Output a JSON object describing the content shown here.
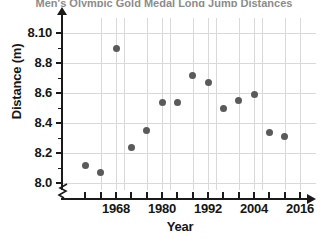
{
  "figure": {
    "title_sliver": "Men's Olympic Gold Medal Long Jump Distances",
    "background_color": "#ffffff",
    "point_color": "#5a5a5a",
    "axis_color": "#1a1a1a",
    "grid_color": "#d9d9d9"
  },
  "axes": {
    "y_title": "Distance (m)",
    "x_title": "Year",
    "y_tick_labels": [
      "8.10",
      "8.8",
      "8.6",
      "8.4",
      "8.2",
      "8.0"
    ],
    "x_tick_labels": [
      "1968",
      "1980",
      "1992",
      "2004",
      "2016"
    ],
    "y_break_symbol": "axis-break"
  },
  "chart_data": {
    "type": "scatter",
    "title": "Men's Olympic Gold Medal Long Jump Distances",
    "xlabel": "Year",
    "ylabel": "Distance (m)",
    "xlim": [
      1957,
      2020
    ],
    "ylim": [
      8.0,
      9.0
    ],
    "xticks": [
      1968,
      1980,
      1992,
      2004,
      2016
    ],
    "xtick_interval_minor": 4,
    "yticks": [
      8.0,
      8.2,
      8.4,
      8.6,
      8.8,
      9.0
    ],
    "ytick_labels": [
      "8.0",
      "8.2",
      "8.4",
      "8.6",
      "8.8",
      "8.10"
    ],
    "grid": true,
    "legend": "none",
    "y_axis_break": true,
    "x": [
      1960,
      1964,
      1968,
      1972,
      1976,
      1980,
      1984,
      1988,
      1992,
      1996,
      2000,
      2004,
      2008,
      2012
    ],
    "y": [
      8.12,
      8.07,
      8.9,
      8.24,
      8.35,
      8.54,
      8.54,
      8.72,
      8.67,
      8.5,
      8.55,
      8.59,
      8.34,
      8.31
    ],
    "points": [
      {
        "year": 1960,
        "distance": 8.12
      },
      {
        "year": 1964,
        "distance": 8.07
      },
      {
        "year": 1968,
        "distance": 8.9
      },
      {
        "year": 1972,
        "distance": 8.24
      },
      {
        "year": 1976,
        "distance": 8.35
      },
      {
        "year": 1980,
        "distance": 8.54
      },
      {
        "year": 1984,
        "distance": 8.54
      },
      {
        "year": 1988,
        "distance": 8.72
      },
      {
        "year": 1992,
        "distance": 8.67
      },
      {
        "year": 1996,
        "distance": 8.5
      },
      {
        "year": 2000,
        "distance": 8.55
      },
      {
        "year": 2004,
        "distance": 8.59
      },
      {
        "year": 2008,
        "distance": 8.34
      },
      {
        "year": 2012,
        "distance": 8.31
      }
    ]
  }
}
